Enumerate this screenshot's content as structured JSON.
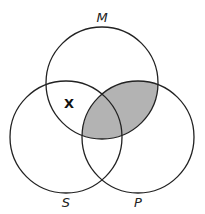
{
  "diagram": {
    "type": "venn-3",
    "circles": [
      {
        "id": "M",
        "label": "M",
        "cx": 102,
        "cy": 83,
        "r": 56
      },
      {
        "id": "S",
        "label": "S",
        "cx": 66,
        "cy": 137,
        "r": 56
      },
      {
        "id": "P",
        "label": "P",
        "cx": 138,
        "cy": 137,
        "r": 56
      }
    ],
    "shaded_regions": [
      "M∩P"
    ],
    "shade_color": "#b3b3b3",
    "stroke_color": "#222222",
    "marks": [
      {
        "symbol": "X",
        "region": "M∩S outside P",
        "x": 69,
        "y": 108
      }
    ]
  },
  "labels": {
    "M": "M",
    "S": "S",
    "P": "P",
    "X": "X"
  }
}
